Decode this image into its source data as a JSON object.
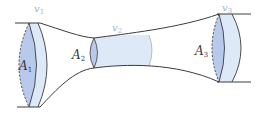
{
  "diagram": {
    "colors": {
      "outline": "#3c3c3c",
      "tube_fill": "#dde9f7",
      "section_fill": "#b9c9ec",
      "velocity_label": "#9fb4d8",
      "area_label": "#3a3a3a"
    },
    "labels": {
      "v1": {
        "base": "v",
        "sub": "1"
      },
      "v2": {
        "base": "v",
        "sub": "2"
      },
      "v3": {
        "base": "v",
        "sub": "3"
      },
      "A1": {
        "base": "A",
        "sub": "1"
      },
      "A2": {
        "base": "A",
        "sub": "2"
      },
      "A3": {
        "base": "A",
        "sub": "3"
      }
    }
  }
}
